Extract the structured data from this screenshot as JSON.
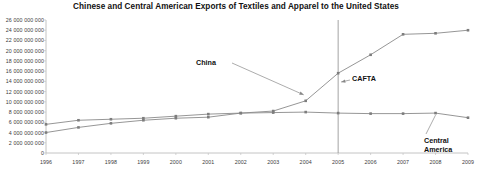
{
  "chart_data": {
    "type": "line",
    "title": "Chinese and Central American Exports of Textiles and Apparel to the United States",
    "xlabel": "",
    "ylabel": "",
    "x": [
      1996,
      1997,
      1998,
      1999,
      2000,
      2001,
      2002,
      2003,
      2004,
      2005,
      2006,
      2007,
      2008,
      2009
    ],
    "xlim": [
      1996,
      2009
    ],
    "ylim": [
      0,
      26000000000
    ],
    "ytick_values": [
      0,
      2000000000,
      4000000000,
      6000000000,
      8000000000,
      10000000000,
      12000000000,
      14000000000,
      16000000000,
      18000000000,
      20000000000,
      22000000000,
      24000000000,
      26000000000
    ],
    "ytick_labels": [
      "0",
      "2 000 000 000",
      "4 000 000 000",
      "6 000 000 000",
      "8 000 000 000",
      "10 000 000 000",
      "12 000 000 000",
      "14 000 000 000",
      "16 000 000 000",
      "18 000 000 000",
      "20 000 000 000",
      "22 000 000 000",
      "24 000 000 000",
      "26 000 000 000"
    ],
    "xtick_labels": [
      "1996",
      "1997",
      "1998",
      "1999",
      "2000",
      "2001",
      "2002",
      "2003",
      "2004",
      "2005",
      "2006",
      "2007",
      "2008",
      "2009"
    ],
    "grid": false,
    "legend": "none",
    "series": [
      {
        "name": "China",
        "color": "#8a8a8a",
        "values": [
          4000000000,
          5000000000,
          5800000000,
          6400000000,
          6800000000,
          7000000000,
          7800000000,
          8200000000,
          10200000000,
          15600000000,
          19200000000,
          23200000000,
          23400000000,
          24000000000
        ]
      },
      {
        "name": "Central America",
        "color": "#8a8a8a",
        "values": [
          5600000000,
          6400000000,
          6600000000,
          6800000000,
          7200000000,
          7600000000,
          7800000000,
          7900000000,
          8000000000,
          7800000000,
          7700000000,
          7700000000,
          7800000000,
          6900000000
        ]
      }
    ],
    "annotations": [
      {
        "name": "china-annotation",
        "text": "China",
        "target_year": 2004,
        "target_value": 10200000000
      },
      {
        "name": "cafta-annotation",
        "text": "CAFTA",
        "target_year": 2005,
        "target_value": 14400000000
      },
      {
        "name": "central-america-annotation",
        "text": "Central America",
        "target_year": 2008,
        "target_value": 7800000000
      }
    ],
    "vertical_marker": {
      "name": "cafta-marker-line",
      "year": 2005,
      "label": "CAFTA",
      "color": "#9a9a9a"
    }
  }
}
